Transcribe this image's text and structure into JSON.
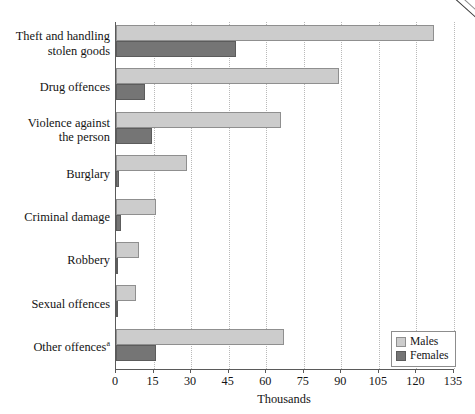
{
  "chart_data": {
    "type": "bar",
    "orientation": "horizontal",
    "title": "",
    "xlabel": "Thousands",
    "ylabel": "",
    "xlim": [
      0,
      135
    ],
    "xticks": [
      0,
      15,
      30,
      45,
      60,
      75,
      90,
      105,
      120,
      135
    ],
    "grid": "vertical-dotted",
    "legend_position": "bottom-right",
    "categories": [
      "Theft and handling stolen goods",
      "Drug offences",
      "Violence against the person",
      "Burglary",
      "Criminal damage",
      "Robbery",
      "Sexual offences",
      "Other offences"
    ],
    "series": [
      {
        "name": "Males",
        "color": "#cccccc",
        "values": [
          127,
          89,
          66,
          28.5,
          16,
          9,
          8,
          67
        ]
      },
      {
        "name": "Females",
        "color": "#757575",
        "values": [
          48,
          11.5,
          14.5,
          1,
          2,
          0.8,
          0.5,
          16
        ]
      }
    ],
    "footnote_marker": "a"
  },
  "axis": {
    "x_title": "Thousands",
    "tick_labels": [
      "0",
      "15",
      "30",
      "45",
      "60",
      "75",
      "90",
      "105",
      "120",
      "135"
    ]
  },
  "categories": [
    {
      "line1": "Theft and handling",
      "line2": "stolen goods",
      "sup": ""
    },
    {
      "line1": "Drug offences",
      "line2": "",
      "sup": ""
    },
    {
      "line1": "Violence against",
      "line2": "the person",
      "sup": ""
    },
    {
      "line1": "Burglary",
      "line2": "",
      "sup": ""
    },
    {
      "line1": "Criminal damage",
      "line2": "",
      "sup": ""
    },
    {
      "line1": "Robbery",
      "line2": "",
      "sup": ""
    },
    {
      "line1": "Sexual offences",
      "line2": "",
      "sup": ""
    },
    {
      "line1": "Other offences",
      "line2": "",
      "sup": "a"
    }
  ],
  "legend": {
    "items": [
      {
        "label": "Males",
        "color": "#cccccc"
      },
      {
        "label": "Females",
        "color": "#757575"
      }
    ]
  }
}
